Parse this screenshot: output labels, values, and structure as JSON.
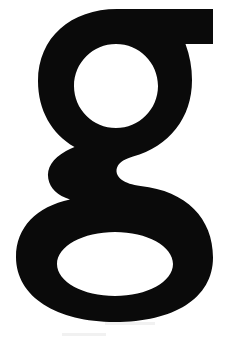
{
  "image": {
    "kind": "typographic-specimen",
    "subject": "lowercase letter g",
    "character": "g",
    "case": "lowercase",
    "script": "Latin",
    "construction": "double-storey",
    "weight": "black",
    "style": "grotesque sans-serif",
    "width_px": 231,
    "height_px": 344,
    "caption": "g"
  },
  "colors": {
    "glyph": "#0a0a0a",
    "background": "#ffffff",
    "artifact": "#f1f1f1"
  },
  "glyph": {
    "label": "g",
    "parts": {
      "ear": "ear",
      "upper_bowl": "upper-bowl",
      "upper_counter": "upper-counter",
      "waist": "waist",
      "lower_loop": "lower-loop",
      "lower_counter": "lower-counter"
    },
    "metrics": {
      "glyph_top_y": 9,
      "glyph_bottom_y": 320,
      "glyph_left_x": 16,
      "glyph_right_x": 213,
      "ear_rect": "150,9 213,44",
      "upper_counter_center": "116,86",
      "upper_counter_radius": 42,
      "lower_counter_center": "115,264",
      "lower_counter_rx": 58,
      "lower_counter_ry": 32
    },
    "path_outer": "M 213,9 L 213,44 L 186,44 C 190,56 192,68 192,80 C 192,124 163,154 124,159 C 110,161 101,166 101,174 C 101,181 107,186 119,188 L 140,190 C 186,194 213,222 213,258 C 213,298 173,322 115,322 C 56,322 16,297 16,257 C 16,226 38,205 72,199 C 56,194 48,185 48,173 C 48,161 57,152 74,146 C 51,133 38,109 38,81 C 38,38 71,9 117,9 Z",
    "path_upper_counter": "M 116,44 C 139,44 158,62 158,86 C 158,110 139,128 116,128 C 93,128 74,110 74,86 C 74,62 93,44 116,44 Z",
    "path_lower_counter": "M 115,232 C 147,232 173,246 173,264 C 173,282 147,296 115,296 C 83,296 57,282 57,264 C 57,246 83,232 115,232 Z"
  }
}
